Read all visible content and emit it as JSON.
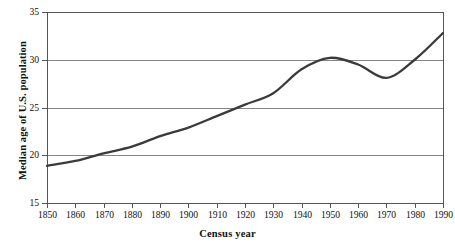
{
  "chart_data": {
    "type": "line",
    "title": "",
    "xlabel": "Census year",
    "ylabel": "Median age of U.S. population",
    "xlim": [
      1850,
      1990
    ],
    "ylim": [
      15,
      35
    ],
    "grid": "horizontal",
    "legend": "none",
    "x_ticks": [
      "1850",
      "1860",
      "1870",
      "1880",
      "1890",
      "1900",
      "1910",
      "1920",
      "1930",
      "1940",
      "1950",
      "1960",
      "1970",
      "1980",
      "1990"
    ],
    "y_ticks": [
      "15",
      "20",
      "25",
      "30",
      "35"
    ],
    "x": [
      1850,
      1860,
      1870,
      1880,
      1890,
      1900,
      1910,
      1920,
      1930,
      1940,
      1950,
      1960,
      1970,
      1980,
      1990
    ],
    "values": [
      18.9,
      19.4,
      20.2,
      20.9,
      22.0,
      22.9,
      24.1,
      25.3,
      26.5,
      29.0,
      30.2,
      29.5,
      28.1,
      30.0,
      32.8
    ],
    "series": [
      {
        "name": "Median age of U.S. population",
        "color": "#3a3a3a",
        "values": [
          18.9,
          19.4,
          20.2,
          20.9,
          22.0,
          22.9,
          24.1,
          25.3,
          26.5,
          29.0,
          30.2,
          29.5,
          28.1,
          30.0,
          32.8
        ]
      }
    ],
    "colors": {
      "line": "#3a3a3a",
      "axis": "#555555",
      "grid": "#777777",
      "background": "#ffffff",
      "text": "#111111"
    }
  }
}
